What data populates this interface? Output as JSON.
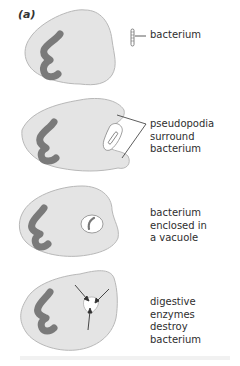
{
  "figure": {
    "panel_label": "(a)",
    "colors": {
      "cell_fill": "#e4e4e4",
      "cell_stroke": "#b8b8b8",
      "nucleus": "#7a7a7a",
      "vacuole_fill": "#ffffff",
      "line": "#333333"
    },
    "stages": [
      {
        "label": "bacterium"
      },
      {
        "label": "pseudopodia\nsurround\nbacterium"
      },
      {
        "label": "bacterium\nenclosed in\na vacuole"
      },
      {
        "label": "digestive enzymes\ndestroy bacterium"
      }
    ]
  }
}
